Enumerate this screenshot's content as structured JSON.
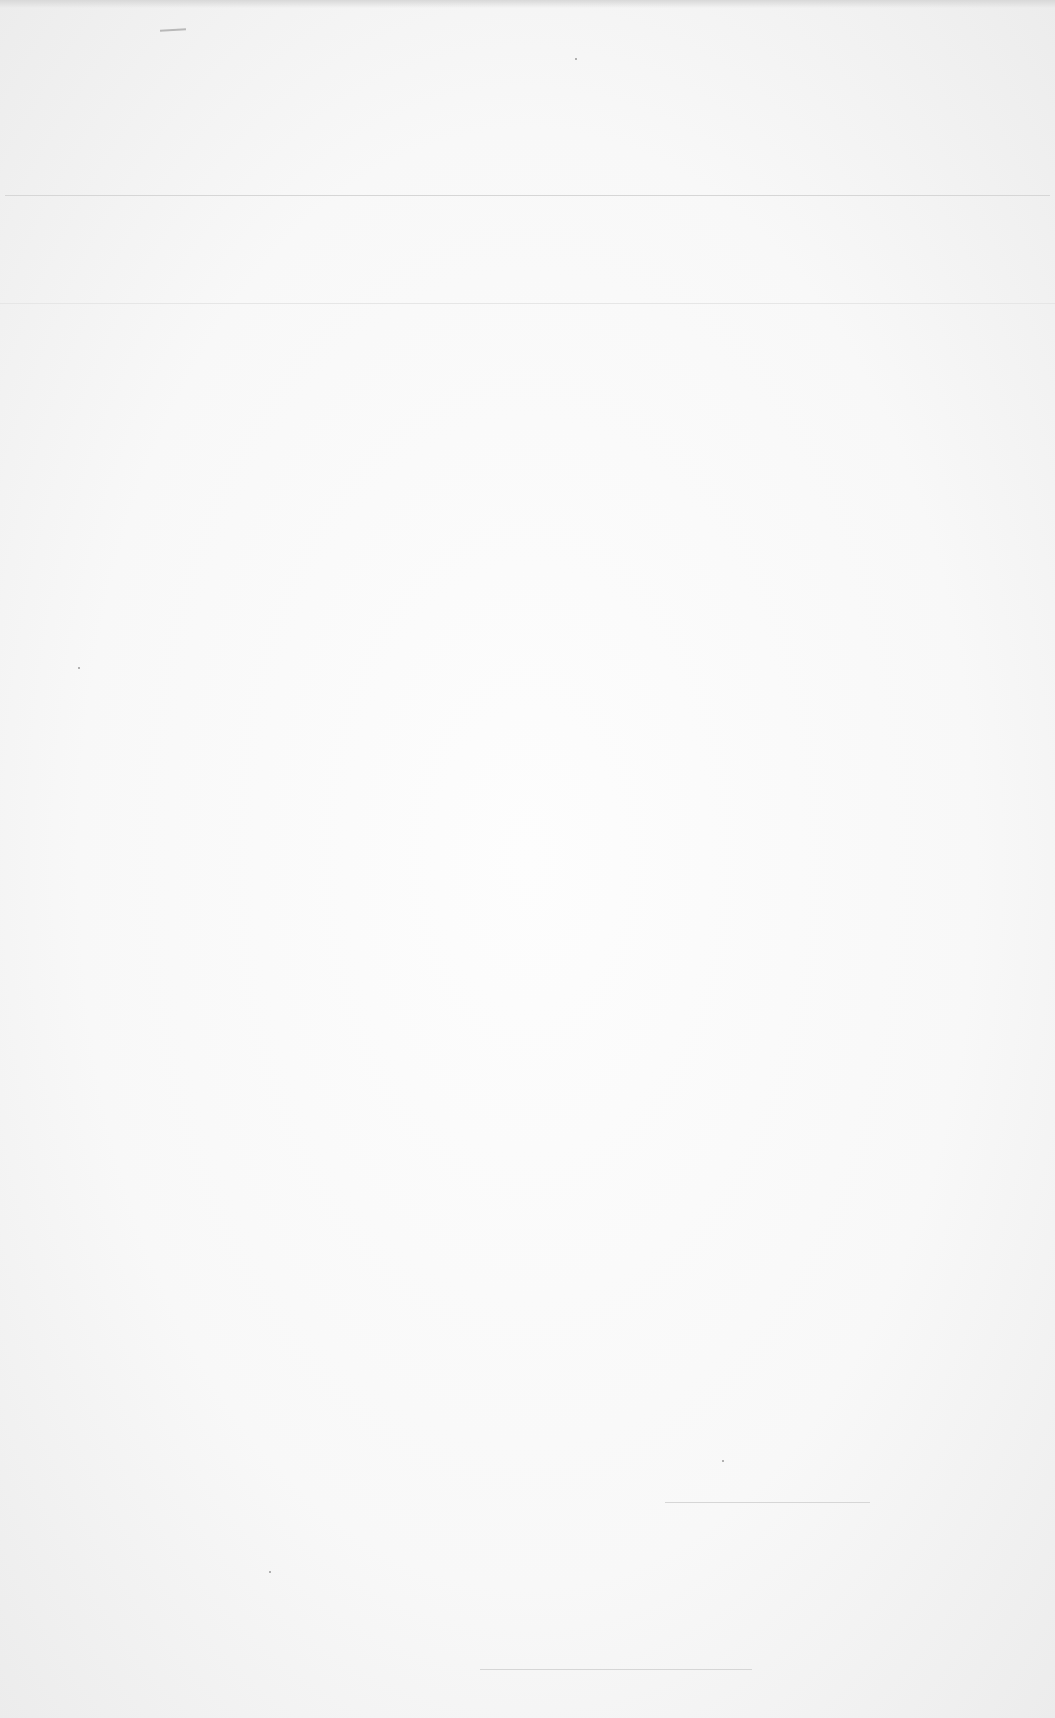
{
  "document": {
    "type": "blank scanned page",
    "text": "",
    "rules": [
      {
        "name": "header-rule",
        "x": 5,
        "y": 195,
        "width": 1045
      },
      {
        "name": "upper-faint-rule",
        "x": 0,
        "y": 303,
        "width": 1055
      },
      {
        "name": "signature-line-right",
        "x": 665,
        "y": 1502,
        "width": 205
      },
      {
        "name": "signature-line-bottom",
        "x": 480,
        "y": 1669,
        "width": 272
      }
    ]
  }
}
